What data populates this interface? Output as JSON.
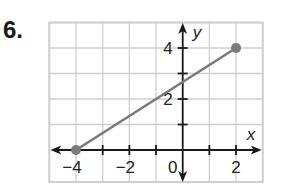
{
  "problem": {
    "number": "6."
  },
  "chart_data": {
    "type": "line",
    "title": "",
    "xlabel": "x",
    "ylabel": "y",
    "xlim": [
      -5,
      3
    ],
    "ylim": [
      -1.25,
      5
    ],
    "grid": true,
    "x_tick_labels": [
      {
        "value": -4,
        "label": "−4"
      },
      {
        "value": -2,
        "label": "−2"
      },
      {
        "value": 0,
        "label": "0"
      },
      {
        "value": 2,
        "label": "2"
      }
    ],
    "y_tick_labels": [
      {
        "value": 2,
        "label": "2"
      },
      {
        "value": 4,
        "label": "4"
      }
    ],
    "series": [
      {
        "name": "segment",
        "points": [
          {
            "x": -4,
            "y": 0
          },
          {
            "x": 2,
            "y": 4
          }
        ],
        "endpoints": "closed",
        "color": "#7a7a7a"
      }
    ],
    "colors": {
      "grid": "#cfcfcf",
      "axis": "#1a1a1a",
      "segment": "#7a7a7a"
    }
  }
}
